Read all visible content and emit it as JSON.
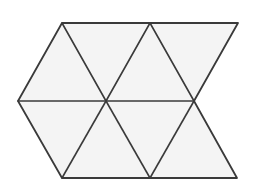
{
  "figure": {
    "canvas": {
      "width": 258,
      "height": 191
    },
    "background_color": "#ffffff",
    "face_fill_color": "#f4f4f4",
    "edge_color": "#3a3a3a",
    "outline_color": "#3a3a3a",
    "edge_width": 1.6,
    "outline_width": 1.8,
    "vertex_count": 9,
    "triangle_count": 6
  },
  "vertices": {
    "top_left": {
      "id": "A",
      "x": 62,
      "y": 23
    },
    "top_middle": {
      "id": "B",
      "x": 150,
      "y": 23
    },
    "top_right": {
      "id": "C",
      "x": 238,
      "y": 23
    },
    "mid_left": {
      "id": "D",
      "x": 18,
      "y": 101
    },
    "mid_center": {
      "id": "E",
      "x": 106,
      "y": 101
    },
    "mid_right": {
      "id": "F",
      "x": 194,
      "y": 101
    },
    "bottom_left": {
      "id": "G",
      "x": 62,
      "y": 178
    },
    "bottom_middle": {
      "id": "H",
      "x": 150,
      "y": 178
    },
    "bottom_right": {
      "id": "I",
      "x": 237,
      "y": 178
    }
  },
  "faces": [
    {
      "name": "triangle-upper-left",
      "orientation": "down",
      "points": "62,23 150,23 106,101"
    },
    {
      "name": "triangle-upper-middle",
      "orientation": "down",
      "points": "150,23 238,23 194,101"
    },
    {
      "name": "triangle-upper-left-wedge",
      "orientation": "up",
      "points": "62,23 106,101 18,101"
    },
    {
      "name": "triangle-upper-right-wedge",
      "orientation": "up",
      "points": "150,23 194,101 106,101"
    },
    {
      "name": "triangle-lower-left",
      "orientation": "up",
      "points": "18,101 106,101 62,178"
    },
    {
      "name": "triangle-lower-middle",
      "orientation": "up",
      "points": "106,101 194,101 150,178"
    },
    {
      "name": "triangle-lower-left-down",
      "orientation": "down",
      "points": "62,178 150,178 106,101"
    },
    {
      "name": "triangle-lower-right-down",
      "orientation": "down",
      "points": "150,178 237,178 194,101"
    }
  ],
  "outline_path": "M 62,23 L 238,23 L 194,101 L 237,178 L 62,178 L 18,101 Z",
  "interior_edges": [
    {
      "name": "edge-horizontal-middle",
      "x1": 18,
      "y1": 101,
      "x2": 194,
      "y2": 101
    },
    {
      "name": "edge-top-left-to-center",
      "x1": 62,
      "y1": 23,
      "x2": 106,
      "y2": 101
    },
    {
      "name": "edge-top-mid-to-center",
      "x1": 150,
      "y1": 23,
      "x2": 106,
      "y2": 101
    },
    {
      "name": "edge-top-mid-to-right",
      "x1": 150,
      "y1": 23,
      "x2": 194,
      "y2": 101
    },
    {
      "name": "edge-center-to-bot-left",
      "x1": 106,
      "y1": 101,
      "x2": 62,
      "y2": 178
    },
    {
      "name": "edge-center-to-bot-mid",
      "x1": 106,
      "y1": 101,
      "x2": 150,
      "y2": 178
    },
    {
      "name": "edge-right-to-bot-mid",
      "x1": 194,
      "y1": 101,
      "x2": 150,
      "y2": 178
    }
  ]
}
